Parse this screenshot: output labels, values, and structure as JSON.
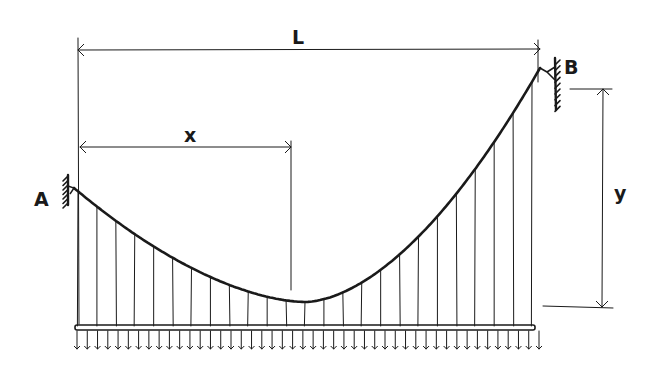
{
  "diagram": {
    "type": "suspension-cable",
    "colors": {
      "ink": "#1a1a1a",
      "background": "#ffffff"
    },
    "labels": {
      "span": "L",
      "horizontal_distance": "x",
      "sag_height": "y",
      "support_left": "A",
      "support_right": "B"
    },
    "geometry": {
      "span_line": {
        "x1": 78,
        "x2": 540,
        "y": 50
      },
      "x_line": {
        "x1": 80,
        "x2": 291,
        "y": 147
      },
      "y_line": {
        "x": 603,
        "y1": 89,
        "y2": 307
      },
      "support_A": {
        "x": 68,
        "y": 190
      },
      "support_B": {
        "x": 555,
        "y": 80
      },
      "cable": {
        "start": [
          74,
          188
        ],
        "low": [
          305,
          302
        ],
        "end": [
          540,
          68
        ]
      },
      "deck": {
        "x1": 75,
        "x2": 535,
        "y": 328
      },
      "hanger_count": 25,
      "load_arrow_count": 46
    }
  }
}
